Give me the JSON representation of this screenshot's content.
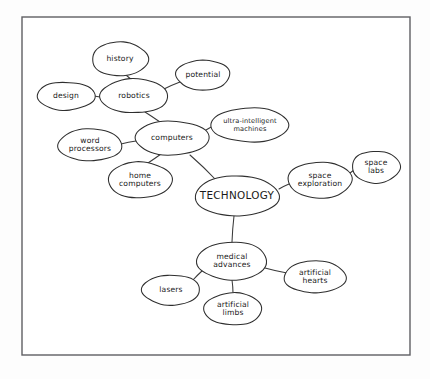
{
  "diagram": {
    "type": "mind-map",
    "frame": {
      "x": 22,
      "y": 17,
      "width": 388,
      "height": 338
    },
    "colors": {
      "background": "#fdfdfd",
      "frame_stroke": "#5f5f63",
      "node_stroke": "#2e2e2e",
      "node_fill": "#ffffff",
      "edge_stroke": "#3a3a3a",
      "text": "#1a1a1a"
    },
    "nodes": [
      {
        "id": "technology",
        "label": "TECHNOLOGY",
        "lines": [
          "TECHNOLOGY"
        ],
        "cx": 237,
        "cy": 196,
        "rx": 42,
        "ry": 20,
        "level": 0
      },
      {
        "id": "computers",
        "label": "computers",
        "lines": [
          "computers"
        ],
        "cx": 172,
        "cy": 138,
        "rx": 37,
        "ry": 17,
        "level": 1
      },
      {
        "id": "space-exploration",
        "label": "space exploration",
        "lines": [
          "space",
          "exploration"
        ],
        "cx": 320,
        "cy": 180,
        "rx": 32,
        "ry": 18,
        "level": 1
      },
      {
        "id": "medical-advances",
        "label": "medical advances",
        "lines": [
          "medical",
          "advances"
        ],
        "cx": 232,
        "cy": 261,
        "rx": 35,
        "ry": 19,
        "level": 1
      },
      {
        "id": "robotics",
        "label": "robotics",
        "lines": [
          "robotics"
        ],
        "cx": 134,
        "cy": 96,
        "rx": 34,
        "ry": 17,
        "level": 2
      },
      {
        "id": "history",
        "label": "history",
        "lines": [
          "history"
        ],
        "cx": 120,
        "cy": 59,
        "rx": 28,
        "ry": 17,
        "level": 3
      },
      {
        "id": "design",
        "label": "design",
        "lines": [
          "design"
        ],
        "cx": 66,
        "cy": 96,
        "rx": 29,
        "ry": 14,
        "level": 3
      },
      {
        "id": "potential",
        "label": "potential",
        "lines": [
          "potential"
        ],
        "cx": 203,
        "cy": 75,
        "rx": 27,
        "ry": 15,
        "level": 3
      },
      {
        "id": "ultra-intelligent-machines",
        "label": "ultra-intelligent machines",
        "lines": [
          "ultra-intelligent",
          "machines"
        ],
        "cx": 250,
        "cy": 125,
        "rx": 39,
        "ry": 17,
        "level": 2
      },
      {
        "id": "word-processors",
        "label": "word processors",
        "lines": [
          "word",
          "processors"
        ],
        "cx": 90,
        "cy": 145,
        "rx": 32,
        "ry": 16,
        "level": 2
      },
      {
        "id": "home-computers",
        "label": "home computers",
        "lines": [
          "home",
          "computers"
        ],
        "cx": 140,
        "cy": 180,
        "rx": 32,
        "ry": 18,
        "level": 2
      },
      {
        "id": "space-labs",
        "label": "space labs",
        "lines": [
          "space",
          "labs"
        ],
        "cx": 376,
        "cy": 167,
        "rx": 24,
        "ry": 16,
        "level": 2
      },
      {
        "id": "lasers",
        "label": "lasers",
        "lines": [
          "lasers"
        ],
        "cx": 171,
        "cy": 290,
        "rx": 29,
        "ry": 15,
        "level": 2
      },
      {
        "id": "artificial-limbs",
        "label": "artificial limbs",
        "lines": [
          "artificial",
          "limbs"
        ],
        "cx": 233,
        "cy": 309,
        "rx": 29,
        "ry": 16,
        "level": 2
      },
      {
        "id": "artificial-hearts",
        "label": "artificial hearts",
        "lines": [
          "artificial",
          "hearts"
        ],
        "cx": 315,
        "cy": 277,
        "rx": 31,
        "ry": 16,
        "level": 2
      }
    ],
    "edges": [
      {
        "from": "technology",
        "to": "computers",
        "x1": 216,
        "y1": 180,
        "x2": 190,
        "y2": 155
      },
      {
        "from": "technology",
        "to": "space-exploration",
        "x1": 279,
        "y1": 189,
        "x2": 289,
        "y2": 184
      },
      {
        "from": "technology",
        "to": "medical-advances",
        "x1": 234,
        "y1": 216,
        "x2": 232,
        "y2": 242
      },
      {
        "from": "computers",
        "to": "robotics",
        "x1": 160,
        "y1": 122,
        "x2": 145,
        "y2": 112
      },
      {
        "from": "computers",
        "to": "ultra-intelligent-machines",
        "x1": 206,
        "y1": 130,
        "x2": 213,
        "y2": 126
      },
      {
        "from": "computers",
        "to": "word-processors",
        "x1": 136,
        "y1": 141,
        "x2": 121,
        "y2": 144
      },
      {
        "from": "computers",
        "to": "home-computers",
        "x1": 161,
        "y1": 154,
        "x2": 148,
        "y2": 163
      },
      {
        "from": "robotics",
        "to": "history",
        "x1": 132,
        "y1": 80,
        "x2": 126,
        "y2": 75
      },
      {
        "from": "robotics",
        "to": "design",
        "x1": 100,
        "y1": 97,
        "x2": 94,
        "y2": 96
      },
      {
        "from": "robotics",
        "to": "potential",
        "x1": 164,
        "y1": 89,
        "x2": 180,
        "y2": 82
      },
      {
        "from": "space-exploration",
        "to": "space-labs",
        "x1": 350,
        "y1": 173,
        "x2": 354,
        "y2": 170
      },
      {
        "from": "medical-advances",
        "to": "lasers",
        "x1": 203,
        "y1": 270,
        "x2": 192,
        "y2": 281
      },
      {
        "from": "medical-advances",
        "to": "artificial-limbs",
        "x1": 232,
        "y1": 280,
        "x2": 233,
        "y2": 293
      },
      {
        "from": "medical-advances",
        "to": "artificial-hearts",
        "x1": 265,
        "y1": 268,
        "x2": 287,
        "y2": 273
      }
    ]
  }
}
